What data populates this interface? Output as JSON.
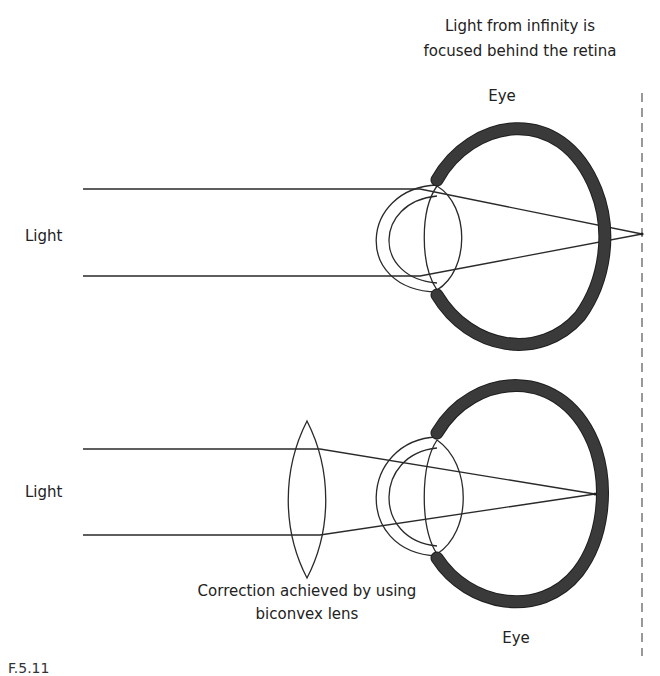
{
  "title_top": {
    "line1": "Light from infinity is",
    "line2": "focused behind the retina"
  },
  "labels": {
    "eye_top": "Eye",
    "eye_bottom": "Eye",
    "light_top": "Light",
    "light_bottom": "Light",
    "correction_line1": "Correction achieved by using",
    "correction_line2": "biconvex lens"
  },
  "caption_partial": "F.5.11",
  "colors": {
    "line": "#2a2a2a",
    "sclera_fill": "#4a4a4a",
    "background": "#ffffff"
  },
  "diagram": {
    "panels": [
      {
        "name": "uncorrected",
        "focus_point": "behind retina"
      },
      {
        "name": "corrected",
        "focus_point": "on retina",
        "corrective_lens": "biconvex"
      }
    ]
  }
}
